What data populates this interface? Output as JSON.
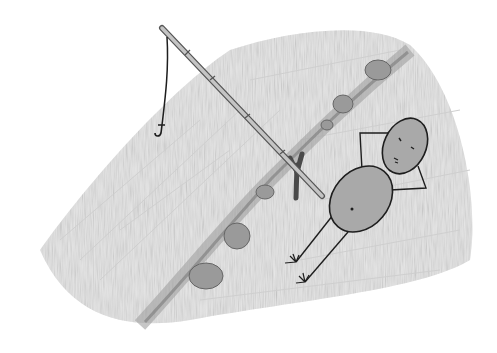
{
  "scene": {
    "description": "Pencil sketch of a stick figure lying on a grassy riverbank next to a fishing rod propped on a forked stick, with a hook dangling over the water",
    "colors": {
      "background": "#ffffff",
      "shading": "#c8c8c8",
      "shading_dark": "#9a9a9a",
      "body_fill": "#a9a9a9",
      "line": "#1e1e1e",
      "rod": "#b5b5b5",
      "stick": "#4a4a4a",
      "rocks": "#8f8f8f"
    },
    "elements": [
      "water-area",
      "riverbank",
      "rocks",
      "fishing-rod",
      "fishing-line",
      "hook",
      "forked-stick",
      "stick-figure"
    ]
  }
}
